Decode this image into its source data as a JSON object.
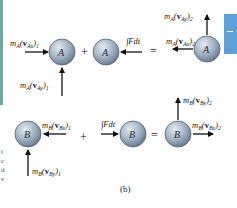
{
  "figure": {
    "caption": "(b)",
    "colors": {
      "sphere_light": "#d9e2ea",
      "sphere_dark": "#6b7f92",
      "side_rule": "#6fa8a0",
      "tab": "#5ea0d6"
    },
    "margin_fragments": [
      "l",
      "c",
      "d",
      "s"
    ],
    "row_a": {
      "body_label": "A",
      "terms": [
        {
          "id": "initial",
          "labels": [
            {
              "mass": "m",
              "mass_sub": "A",
              "vel_sub": "Ax",
              "index": "1",
              "direction": "right"
            },
            {
              "mass": "m",
              "mass_sub": "A",
              "vel_sub": "Ay",
              "index": "1",
              "direction": "up"
            }
          ]
        },
        {
          "id": "impulse",
          "labels": [
            {
              "text": "∫Fdt",
              "direction": "left"
            }
          ]
        },
        {
          "id": "final",
          "labels": [
            {
              "mass": "m",
              "mass_sub": "A",
              "vel_sub": "Ax",
              "index": "2",
              "direction": "left"
            },
            {
              "mass": "m",
              "mass_sub": "A",
              "vel_sub": "Ay",
              "index": "2",
              "direction": "up"
            }
          ]
        }
      ],
      "operators": [
        "+",
        "="
      ]
    },
    "row_b": {
      "body_label": "B",
      "terms": [
        {
          "id": "initial",
          "labels": [
            {
              "mass": "m",
              "mass_sub": "B",
              "vel_sub": "Bx",
              "index": "1",
              "direction": "left"
            },
            {
              "mass": "m",
              "mass_sub": "B",
              "vel_sub": "By",
              "index": "1",
              "direction": "up"
            }
          ]
        },
        {
          "id": "impulse",
          "labels": [
            {
              "text": "∫Fdt",
              "direction": "right"
            }
          ]
        },
        {
          "id": "final",
          "labels": [
            {
              "mass": "m",
              "mass_sub": "B",
              "vel_sub": "Bx",
              "index": "2",
              "direction": "right"
            },
            {
              "mass": "m",
              "mass_sub": "B",
              "vel_sub": "By",
              "index": "2",
              "direction": "up"
            }
          ]
        }
      ],
      "operators": [
        "+",
        "="
      ]
    }
  }
}
